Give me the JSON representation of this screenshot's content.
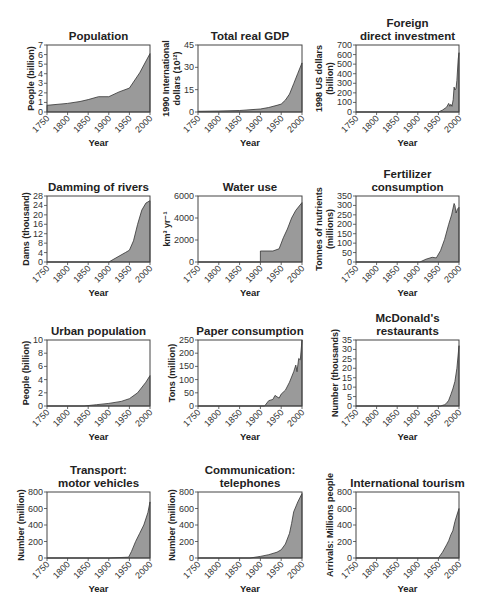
{
  "figure": {
    "layout": {
      "rows": 4,
      "cols": 3
    },
    "fill_color": "#9a9a9a",
    "line_color": "#333333",
    "axis_color": "#444444"
  },
  "chart_data": [
    {
      "id": "population",
      "type": "area",
      "title": [
        "Population"
      ],
      "xlabel": "Year",
      "ylabel": [
        "People (billion)"
      ],
      "xlim": [
        1750,
        2000
      ],
      "ylim": [
        0,
        7
      ],
      "xticks": [
        1750,
        1800,
        1850,
        1900,
        1950,
        2000
      ],
      "yticks": [
        0,
        1,
        2,
        3,
        4,
        5,
        6,
        7
      ],
      "x": [
        1750,
        1800,
        1830,
        1850,
        1875,
        1900,
        1925,
        1950,
        1975,
        2000
      ],
      "values": [
        0.7,
        0.9,
        1.1,
        1.3,
        1.6,
        1.6,
        2.1,
        2.5,
        4.1,
        6.1
      ]
    },
    {
      "id": "gdp",
      "type": "area",
      "title": [
        "Total real GDP"
      ],
      "xlabel": "Year",
      "ylabel": [
        "1990 International",
        "dollars (10¹²)"
      ],
      "xlim": [
        1750,
        2000
      ],
      "ylim": [
        0,
        45
      ],
      "xticks": [
        1750,
        1800,
        1850,
        1900,
        1950,
        2000
      ],
      "yticks": [
        0,
        15,
        30,
        45
      ],
      "x": [
        1750,
        1800,
        1850,
        1900,
        1920,
        1940,
        1950,
        1960,
        1970,
        1980,
        1990,
        2000
      ],
      "values": [
        0.5,
        0.7,
        1,
        2,
        3,
        4.5,
        5.3,
        8,
        12,
        19,
        26,
        33
      ]
    },
    {
      "id": "fdi",
      "type": "area",
      "title": [
        "Foreign",
        "direct investment"
      ],
      "xlabel": "Year",
      "ylabel": [
        "1998 US dollars",
        "(billion)"
      ],
      "xlim": [
        1750,
        2000
      ],
      "ylim": [
        0,
        700
      ],
      "xticks": [
        1750,
        1800,
        1850,
        1900,
        1950,
        2000
      ],
      "yticks": [
        0,
        100,
        200,
        300,
        400,
        500,
        600,
        700
      ],
      "x": [
        1750,
        1950,
        1960,
        1970,
        1975,
        1978,
        1980,
        1983,
        1986,
        1988,
        1990,
        1993,
        1995,
        1998,
        2000
      ],
      "values": [
        0,
        0,
        20,
        50,
        90,
        60,
        80,
        60,
        130,
        260,
        230,
        250,
        330,
        550,
        620
      ]
    },
    {
      "id": "dams",
      "type": "area",
      "title": [
        "Damming of rivers"
      ],
      "xlabel": "Year",
      "ylabel": [
        "Dams (thousand)"
      ],
      "xlim": [
        1750,
        2000
      ],
      "ylim": [
        0,
        28
      ],
      "xticks": [
        1750,
        1800,
        1850,
        1900,
        1950,
        2000
      ],
      "yticks": [
        0,
        4,
        8,
        12,
        16,
        20,
        24,
        28
      ],
      "x": [
        1750,
        1900,
        1920,
        1940,
        1950,
        1960,
        1970,
        1980,
        1990,
        2000
      ],
      "values": [
        0,
        0,
        2,
        4,
        5,
        9,
        16,
        22,
        25,
        26
      ]
    },
    {
      "id": "water",
      "type": "area",
      "title": [
        "Water use"
      ],
      "xlabel": "Year",
      "ylabel": [
        "km³ yr⁻¹"
      ],
      "xlim": [
        1750,
        2000
      ],
      "ylim": [
        0,
        6000
      ],
      "xticks": [
        1750,
        1800,
        1850,
        1900,
        1950,
        2000
      ],
      "yticks": [
        0,
        2000,
        4000,
        6000
      ],
      "x": [
        1750,
        1900,
        1900,
        1930,
        1945,
        1955,
        1965,
        1975,
        1985,
        2000
      ],
      "values": [
        0,
        0,
        1000,
        1000,
        1200,
        2200,
        3000,
        4000,
        4700,
        5400
      ]
    },
    {
      "id": "fertilizer",
      "type": "area",
      "title": [
        "Fertilizer",
        "consumption"
      ],
      "xlabel": "Year",
      "ylabel": [
        "Tonnes of nutrients",
        "(millions)"
      ],
      "xlim": [
        1750,
        2000
      ],
      "ylim": [
        0,
        350
      ],
      "xticks": [
        1750,
        1800,
        1850,
        1900,
        1950,
        2000
      ],
      "yticks": [
        0,
        50,
        100,
        150,
        200,
        250,
        300,
        350
      ],
      "x": [
        1750,
        1905,
        1920,
        1935,
        1945,
        1955,
        1965,
        1975,
        1982,
        1988,
        1990,
        1993,
        1996,
        2000
      ],
      "values": [
        0,
        0,
        15,
        25,
        22,
        60,
        120,
        200,
        250,
        310,
        300,
        260,
        280,
        290
      ]
    },
    {
      "id": "urban",
      "type": "area",
      "title": [
        "Urban population"
      ],
      "xlabel": "Year",
      "ylabel": [
        "People (billion)"
      ],
      "xlim": [
        1750,
        2000
      ],
      "ylim": [
        0,
        10
      ],
      "xticks": [
        1750,
        1800,
        1850,
        1900,
        1950,
        2000
      ],
      "yticks": [
        0,
        2,
        4,
        6,
        8,
        10
      ],
      "x": [
        1750,
        1840,
        1870,
        1900,
        1930,
        1950,
        1970,
        1990,
        2000
      ],
      "values": [
        0,
        0,
        0.2,
        0.4,
        0.7,
        1.1,
        2,
        3.6,
        4.6
      ]
    },
    {
      "id": "paper",
      "type": "area",
      "title": [
        "Paper consumption"
      ],
      "xlabel": "Year",
      "ylabel": [
        "Tons (million)"
      ],
      "xlim": [
        1750,
        2000
      ],
      "ylim": [
        0,
        250
      ],
      "xticks": [
        1750,
        1800,
        1850,
        1900,
        1950,
        2000
      ],
      "yticks": [
        0,
        50,
        100,
        150,
        200,
        250
      ],
      "x": [
        1750,
        1910,
        1920,
        1930,
        1935,
        1940,
        1945,
        1950,
        1960,
        1970,
        1980,
        1985,
        1988,
        1992,
        1996,
        2000
      ],
      "values": [
        0,
        0,
        20,
        25,
        40,
        35,
        30,
        45,
        60,
        90,
        130,
        155,
        130,
        180,
        175,
        250
      ]
    },
    {
      "id": "mcdonalds",
      "type": "area",
      "title": [
        "McDonald's",
        "restaurants"
      ],
      "xlabel": "Year",
      "ylabel": [
        "Number (thousands)"
      ],
      "xlim": [
        1750,
        2000
      ],
      "ylim": [
        0,
        35
      ],
      "xticks": [
        1750,
        1800,
        1850,
        1900,
        1950,
        2000
      ],
      "yticks": [
        0,
        5,
        10,
        15,
        20,
        25,
        30,
        35
      ],
      "x": [
        1750,
        1955,
        1965,
        1970,
        1975,
        1980,
        1985,
        1990,
        1995,
        2000
      ],
      "values": [
        0,
        0,
        0.7,
        1.5,
        3,
        6,
        9,
        13,
        20,
        32
      ]
    },
    {
      "id": "vehicles",
      "type": "area",
      "title": [
        "Transport:",
        "motor vehicles"
      ],
      "xlabel": "Year",
      "ylabel": [
        "Number (million)"
      ],
      "xlim": [
        1750,
        2000
      ],
      "ylim": [
        0,
        800
      ],
      "xticks": [
        1750,
        1800,
        1850,
        1900,
        1950,
        2000
      ],
      "yticks": [
        0,
        200,
        400,
        600,
        800
      ],
      "x": [
        1750,
        1900,
        1948,
        1955,
        1965,
        1975,
        1985,
        1995,
        2000
      ],
      "values": [
        0,
        0,
        10,
        80,
        200,
        300,
        400,
        550,
        680
      ]
    },
    {
      "id": "telephones",
      "type": "area",
      "title": [
        "Communication:",
        "telephones"
      ],
      "xlabel": "Year",
      "ylabel": [
        "Number (million)"
      ],
      "xlim": [
        1750,
        2000
      ],
      "ylim": [
        0,
        800
      ],
      "xticks": [
        1750,
        1800,
        1850,
        1900,
        1950,
        2000
      ],
      "yticks": [
        0,
        200,
        400,
        600,
        800
      ],
      "x": [
        1750,
        1875,
        1900,
        1920,
        1940,
        1950,
        1960,
        1970,
        1975,
        1980,
        1990,
        2000
      ],
      "values": [
        0,
        0,
        20,
        40,
        70,
        100,
        170,
        300,
        420,
        560,
        680,
        780
      ]
    },
    {
      "id": "tourism",
      "type": "area",
      "title": [
        "International tourism"
      ],
      "xlabel": "Year",
      "ylabel": [
        "Arrivals: Millions people"
      ],
      "xlim": [
        1750,
        2000
      ],
      "ylim": [
        0,
        800
      ],
      "xticks": [
        1750,
        1800,
        1850,
        1900,
        1950,
        2000
      ],
      "yticks": [
        0,
        200,
        400,
        600,
        800
      ],
      "x": [
        1750,
        1950,
        1960,
        1970,
        1975,
        1980,
        1985,
        1990,
        1995,
        2000
      ],
      "values": [
        0,
        0,
        70,
        160,
        210,
        280,
        330,
        440,
        520,
        600
      ]
    }
  ]
}
